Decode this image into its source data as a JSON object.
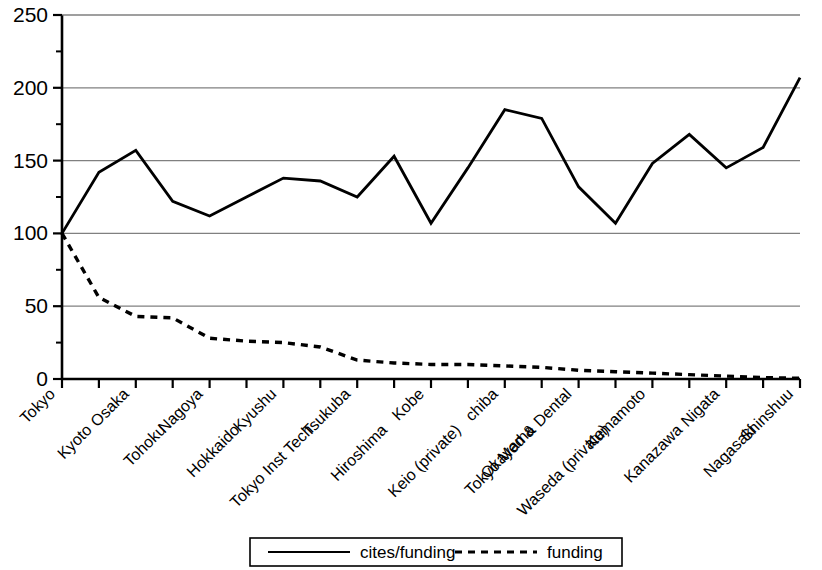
{
  "chart_data": {
    "type": "line",
    "title": "",
    "subtitle": "",
    "xlabel": "",
    "ylabel": "",
    "ylim": [
      0,
      250
    ],
    "yticks": [
      0,
      50,
      100,
      150,
      200,
      250
    ],
    "ytick_labels": [
      "0",
      "50",
      "100",
      "150",
      "200",
      "250"
    ],
    "grid": true,
    "grid_axis": "y",
    "legend_position": "bottom-center",
    "categories": [
      "Tokyo",
      "Kyoto",
      "Osaka",
      "Tohoku",
      "Nagoya",
      "Hokkaido",
      "Kyushu",
      "Tokyo Inst Tech",
      "Tsukuba",
      "Hiroshima",
      "Kobe",
      "Keio (private)",
      "chiba",
      "Okayama",
      "Tokyo Med & Dental",
      "Waseda (private)",
      "Kumamoto",
      "Kanazawa",
      "Nigata",
      "Nagasaki",
      "Shinshuu"
    ],
    "series": [
      {
        "name": "cites/funding",
        "style": "solid",
        "color": "#000000",
        "values": [
          100,
          142,
          157,
          122,
          112,
          125,
          138,
          136,
          125,
          153,
          107,
          145,
          185,
          179,
          132,
          107,
          148,
          168,
          145,
          159,
          207
        ]
      },
      {
        "name": "funding",
        "style": "dashed",
        "color": "#000000",
        "values": [
          100,
          56,
          43,
          42,
          28,
          26,
          25,
          22,
          13,
          11,
          10,
          10,
          9,
          8,
          6,
          5,
          4,
          3,
          2,
          1,
          0.5
        ]
      }
    ]
  },
  "legend": {
    "entries": [
      {
        "label": "cites/funding",
        "style": "solid"
      },
      {
        "label": "funding",
        "style": "dashed"
      }
    ]
  },
  "axis": {
    "y_labels": [
      "250",
      "200",
      "150",
      "100",
      "50",
      "0"
    ],
    "x_labels": [
      "Tokyo",
      "Kyoto",
      "Osaka",
      "Tohoku",
      "Nagoya",
      "Hokkaido",
      "Kyushu",
      "Tokyo Inst Tech",
      "Tsukuba",
      "Hiroshima",
      "Kobe",
      "Keio (private)",
      "chiba",
      "Okayama",
      "Tokyo Med & Dental",
      "Waseda (private)",
      "Kumamoto",
      "Kanazawa",
      "Nigata",
      "Nagasaki",
      "Shinshuu"
    ]
  },
  "colors": {
    "line": "#000000",
    "grid": "#808080",
    "axis": "#000000",
    "background": "#ffffff"
  }
}
